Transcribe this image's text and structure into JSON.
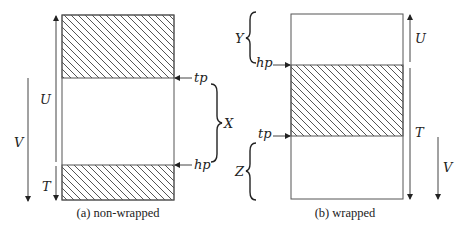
{
  "colors": {
    "line": "#333333",
    "hatch": "#555555",
    "background": "#ffffff"
  },
  "panel_a": {
    "caption": "(a) non-wrapped",
    "labels": {
      "U": "U",
      "V": "V",
      "T": "T",
      "X": "X",
      "tp": "tp",
      "hp": "hp"
    }
  },
  "panel_b": {
    "caption": "(b) wrapped",
    "labels": {
      "U": "U",
      "V": "V",
      "T": "T",
      "Y": "Y",
      "Z": "Z",
      "tp": "tp",
      "hp": "hp"
    }
  }
}
